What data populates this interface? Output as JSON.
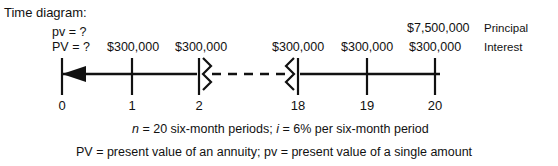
{
  "title": "Time diagram:",
  "left_notes": {
    "pv_single": "pv = ?",
    "pv_annuity": "PV = ?"
  },
  "cash_flows": [
    {
      "label": "$300,000",
      "period": 1
    },
    {
      "label": "$300,000",
      "period": 2
    },
    {
      "label": "$300,000",
      "period": 18
    },
    {
      "label": "$300,000",
      "period": 19
    },
    {
      "label": "$300,000",
      "period": 20
    }
  ],
  "principal_at_maturity": "$7,500,000",
  "right_labels": {
    "principal": "Principal",
    "interest": "Interest"
  },
  "timeline": {
    "tick_labels": [
      "0",
      "1",
      "2",
      "18",
      "19",
      "20"
    ],
    "break_count": 2,
    "arrow_direction": "left"
  },
  "footnotes": {
    "line1_a": "n",
    "line1_b": " = 20 six-month periods; ",
    "line1_c": "i",
    "line1_d": " = 6% per six-month period",
    "line2": "PV = present value of an annuity; pv = present value of a single amount"
  },
  "colors": {
    "ink": "#111111",
    "background": "#ffffff"
  }
}
